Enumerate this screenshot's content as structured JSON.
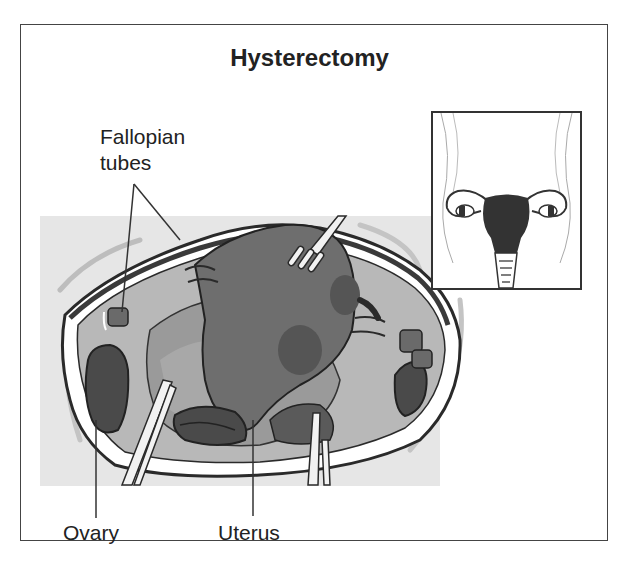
{
  "title": "Hysterectomy",
  "labels": {
    "fallopian_tubes_line1": "Fallopian",
    "fallopian_tubes_line2": "tubes",
    "ovary": "Ovary",
    "uterus": "Uterus"
  },
  "colors": {
    "background": "#ffffff",
    "frame_border": "#444444",
    "surgical_field": "#e6e6e6",
    "tissue_light": "#c4c4c4",
    "tissue_mid": "#8f8f8f",
    "uterus": "#6e6e6e",
    "organ_dark": "#4a4a4a",
    "outline": "#2a2a2a"
  }
}
